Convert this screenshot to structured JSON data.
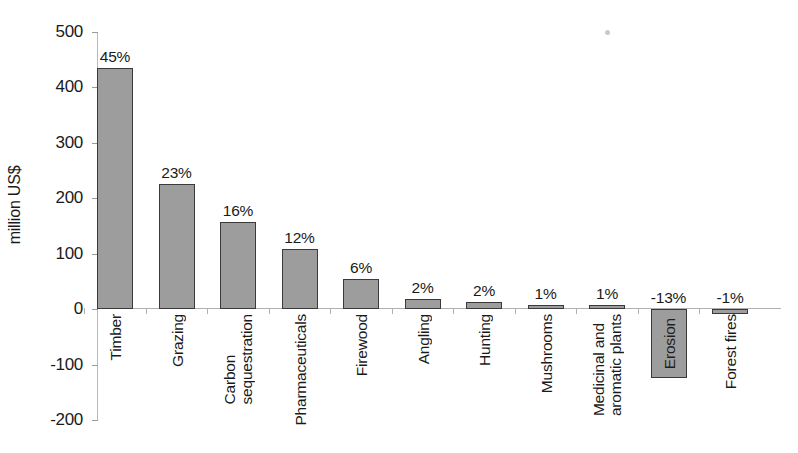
{
  "chart_data": {
    "type": "bar",
    "title": "",
    "xlabel": "",
    "ylabel": "million US$",
    "ylim": [
      -200,
      500
    ],
    "ytick_labels": [
      "500",
      "400",
      "300",
      "200",
      "100",
      "0",
      "-100",
      "-200"
    ],
    "ytick_values": [
      500,
      400,
      300,
      200,
      100,
      0,
      -100,
      -200
    ],
    "grid": false,
    "legend": "none",
    "categories": [
      "Timber",
      "Grazing",
      "Carbon sequestration",
      "Pharmaceuticals",
      "Firewood",
      "Angling",
      "Hunting",
      "Mushrooms",
      "Medicinal and aromatic plants",
      "Erosion",
      "Forest fires"
    ],
    "values": [
      435,
      225,
      157,
      108,
      54,
      19,
      13,
      8,
      7,
      -125,
      -8
    ],
    "data_labels": [
      "45%",
      "23%",
      "16%",
      "12%",
      "6%",
      "2%",
      "2%",
      "1%",
      "1%",
      "-13%",
      "-1%"
    ],
    "bars": [
      {
        "category": "Timber",
        "label_line1": "Timber",
        "label_line2": "",
        "value": 435,
        "data_label": "45%",
        "label_inside": false
      },
      {
        "category": "Grazing",
        "label_line1": "Grazing",
        "label_line2": "",
        "value": 225,
        "data_label": "23%",
        "label_inside": false
      },
      {
        "category": "Carbon sequestration",
        "label_line1": "Carbon",
        "label_line2": "sequestration",
        "value": 157,
        "data_label": "16%",
        "label_inside": false
      },
      {
        "category": "Pharmaceuticals",
        "label_line1": "Pharmaceuticals",
        "label_line2": "",
        "value": 108,
        "data_label": "12%",
        "label_inside": false
      },
      {
        "category": "Firewood",
        "label_line1": "Firewood",
        "label_line2": "",
        "value": 54,
        "data_label": "6%",
        "label_inside": false
      },
      {
        "category": "Angling",
        "label_line1": "Angling",
        "label_line2": "",
        "value": 19,
        "data_label": "2%",
        "label_inside": false
      },
      {
        "category": "Hunting",
        "label_line1": "Hunting",
        "label_line2": "",
        "value": 13,
        "data_label": "2%",
        "label_inside": false
      },
      {
        "category": "Mushrooms",
        "label_line1": "Mushrooms",
        "label_line2": "",
        "value": 8,
        "data_label": "1%",
        "label_inside": false
      },
      {
        "category": "Medicinal and aromatic plants",
        "label_line1": "Medicinal and",
        "label_line2": "aromatic plants",
        "value": 7,
        "data_label": "1%",
        "label_inside": false
      },
      {
        "category": "Erosion",
        "label_line1": "Erosion",
        "label_line2": "",
        "value": -125,
        "data_label": "-13%",
        "label_inside": true
      },
      {
        "category": "Forest fires",
        "label_line1": "Forest fires",
        "label_line2": "",
        "value": -8,
        "data_label": "-1%",
        "label_inside": false
      }
    ],
    "colors": {
      "bar_fill": "#9d9d9d",
      "bar_border": "#3a3a3a",
      "axis": "#b0b0b0",
      "text": "#1a1a1a",
      "background": "#ffffff"
    }
  }
}
